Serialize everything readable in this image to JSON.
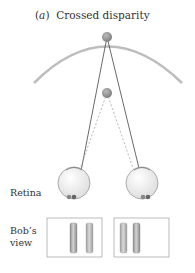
{
  "figure": {
    "panel_letter": "a",
    "title": "Crossed disparity",
    "labels": {
      "retina": "Retina",
      "bobs_view_line1": "Bob’s",
      "bobs_view_line2": "view"
    }
  },
  "colors": {
    "horopter": "#b8b8b8",
    "fixation_point": "#8e8e8e",
    "near_point": "#9a9a9a",
    "lines": "#444444",
    "dashed_lines": "#9a9a9a",
    "eye_fill": "#f5f5f5",
    "rod_fill": "#b0b0b0"
  }
}
